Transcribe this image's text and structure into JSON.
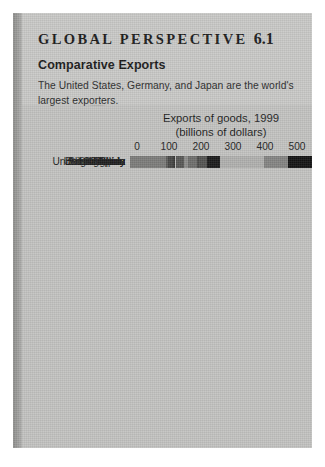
{
  "panel": {
    "title_text": "GLOBAL PERSPECTIVE",
    "title_number": "6.1",
    "subtitle": "Comparative Exports",
    "blurb": "The United States, Germany, and Japan are the world's largest exporters.",
    "source": "Source: World Trade Organization. [www.wto.org]",
    "watermark_icon": "globe-icon"
  },
  "chart_data": {
    "type": "bar",
    "orientation": "horizontal",
    "title": "Exports of goods, 1999",
    "subtitle": "(billions of dollars)",
    "xlabel": "",
    "ylabel": "",
    "xlim": [
      0,
      600
    ],
    "xticks": [
      0,
      100,
      200,
      300,
      400,
      500,
      600
    ],
    "tick_labels": [
      "0",
      "100",
      "200",
      "300",
      "400",
      "500",
      "600"
    ],
    "grid": true,
    "grid_axis": "x",
    "legend": false,
    "categories": [
      "United States",
      "Germany",
      "Japan",
      "France",
      "United Kingdom",
      "Canada",
      "Italy",
      "Netherlands",
      "China",
      "Belgium-Lux.",
      "South Korea",
      "Mexico",
      "Taiwan",
      "Singapore",
      "Spain"
    ],
    "values": [
      620,
      495,
      420,
      280,
      240,
      215,
      210,
      175,
      180,
      170,
      145,
      140,
      135,
      120,
      112
    ],
    "bar_colors": [
      "#141414",
      "#848482",
      "#b0b0ae",
      "#1b1b1b",
      "#545452",
      "#4c4c4a",
      "#6e6e6c",
      "#b4b4b2",
      "#8c8c8a",
      "#585856",
      "#b8b8b6",
      "#3a3a38",
      "#484846",
      "#5e5e5c",
      "#7c7c7a"
    ]
  }
}
